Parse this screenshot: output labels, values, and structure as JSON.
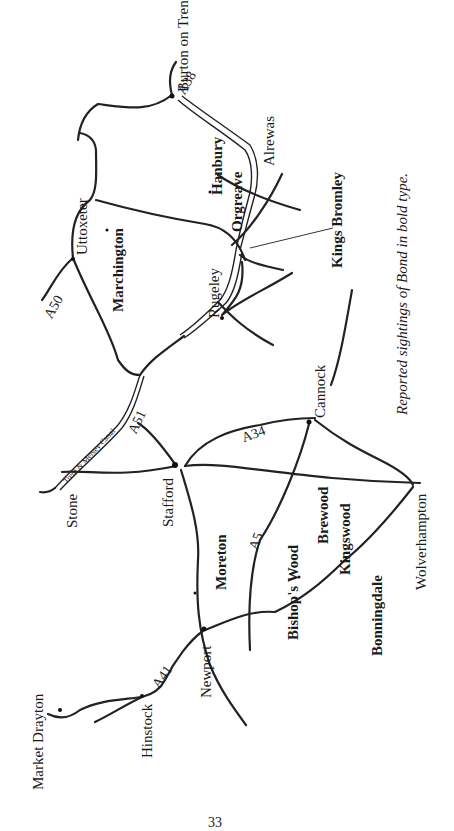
{
  "map": {
    "orientation": "rotated -90deg",
    "places_regular": [
      {
        "id": "burton-on-trent",
        "name": "Burton on Trent"
      },
      {
        "id": "alrewas",
        "name": "Alrewas"
      },
      {
        "id": "uttoxeter",
        "name": "Uttoxeter"
      },
      {
        "id": "rugeley",
        "name": "Rugeley"
      },
      {
        "id": "cannock",
        "name": "Cannock"
      },
      {
        "id": "stone",
        "name": "Stone"
      },
      {
        "id": "stafford",
        "name": "Stafford"
      },
      {
        "id": "wolverhampton",
        "name": "Wolverhampton"
      },
      {
        "id": "newport",
        "name": "Newport"
      },
      {
        "id": "hinstock",
        "name": "Hinstock"
      },
      {
        "id": "market-drayton",
        "name": "Market Drayton"
      }
    ],
    "places_bold": [
      {
        "id": "hanbury",
        "name": "Hanbury"
      },
      {
        "id": "orgreave",
        "name": "Orgreave"
      },
      {
        "id": "kings-bromley",
        "name": "Kings Bromley"
      },
      {
        "id": "marchington",
        "name": "Marchington"
      },
      {
        "id": "moreton",
        "name": "Moreton"
      },
      {
        "id": "brewood",
        "name": "Brewood"
      },
      {
        "id": "kingswood",
        "name": "Kingswood"
      },
      {
        "id": "bishops-wood",
        "name": "Bishop's Wood"
      },
      {
        "id": "bonningdale",
        "name": "Bonningdale"
      }
    ],
    "roads": [
      "A38",
      "A50",
      "A51",
      "A34",
      "A5",
      "A41"
    ],
    "canal_label": "Trent & Mersey Canal",
    "legend_note": "Reported sightings of Bond in bold type.",
    "page_number": "33"
  }
}
